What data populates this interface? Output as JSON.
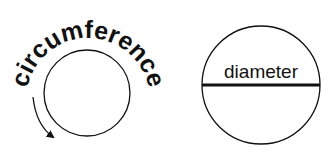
{
  "diagram": {
    "left": {
      "label": "circumference",
      "shape": "circle",
      "arrow_direction": "clockwise-down"
    },
    "right": {
      "label": "diameter",
      "shape": "circle-with-horizontal-diameter"
    },
    "colors": {
      "stroke": "#111111",
      "background": "#ffffff"
    }
  }
}
